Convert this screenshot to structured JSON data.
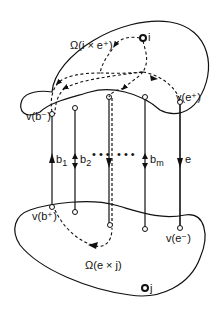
{
  "diagram": {
    "type": "graph-cut-region-diagram",
    "regions": {
      "upper": {
        "label": "Ω(i × e⁺)"
      },
      "lower": {
        "label": "Ω(e × j)"
      }
    },
    "vertices": {
      "i": {
        "label": "i"
      },
      "j": {
        "label": "j"
      },
      "v_b_minus": {
        "label": "v(b⁻)"
      },
      "v_b_plus": {
        "label": "v(b⁺)"
      },
      "v_e_plus": {
        "label": "v(e⁺)"
      },
      "v_e_minus": {
        "label": "v(e⁻)"
      }
    },
    "edges": {
      "b1": {
        "label": "b",
        "sub": "1"
      },
      "b2": {
        "label": "b",
        "sub": "2"
      },
      "bm": {
        "label": "b",
        "sub": "m"
      },
      "e": {
        "label": "e"
      },
      "ellipsis": "• • •"
    },
    "colors": {
      "stroke": "#111111",
      "background": "#ffffff"
    }
  }
}
